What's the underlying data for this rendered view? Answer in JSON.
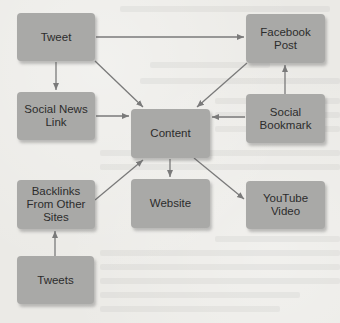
{
  "diagram": {
    "type": "flow",
    "colors": {
      "background": "#ebeae6",
      "node_fill": "#a9a9a7",
      "node_text": "#2c2c2c",
      "arrow": "#7a7a7a"
    },
    "nodes": {
      "tweet": {
        "label": "Tweet"
      },
      "facebook_post": {
        "label": "Facebook\nPost"
      },
      "social_news_link": {
        "label": "Social News\nLink"
      },
      "content": {
        "label": "Content"
      },
      "social_bookmark": {
        "label": "Social\nBookmark"
      },
      "backlinks": {
        "label": "Backlinks\nFrom Other\nSites"
      },
      "website": {
        "label": "Website"
      },
      "youtube_video": {
        "label": "YouTube\nVideo"
      },
      "tweets": {
        "label": "Tweets"
      }
    },
    "edges": [
      {
        "from": "Tweet",
        "to": "Facebook Post"
      },
      {
        "from": "Tweet",
        "to": "Social News Link"
      },
      {
        "from": "Tweet",
        "to": "Content"
      },
      {
        "from": "Facebook Post",
        "to": "Content"
      },
      {
        "from": "Social Bookmark",
        "to": "Facebook Post"
      },
      {
        "from": "Social News Link",
        "to": "Content"
      },
      {
        "from": "Social Bookmark",
        "to": "Content"
      },
      {
        "from": "Backlinks From Other Sites",
        "to": "Content"
      },
      {
        "from": "Content",
        "to": "Website"
      },
      {
        "from": "Content",
        "to": "YouTube Video"
      },
      {
        "from": "Tweets",
        "to": "Backlinks From Other Sites"
      }
    ]
  }
}
